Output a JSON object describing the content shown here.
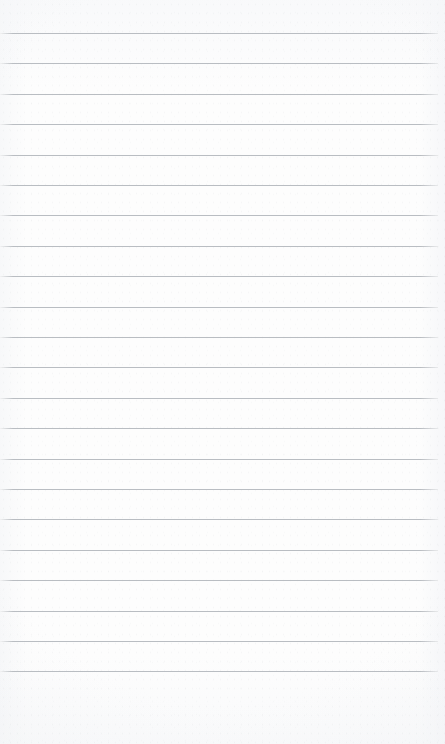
{
  "document": {
    "kind": "lined-notepad-page",
    "title": "",
    "body_text": "",
    "has_handwriting": false,
    "orientation": "portrait"
  },
  "page": {
    "width_px": 445,
    "height_px": 744,
    "background_color": "#fdfdfd",
    "paper_tone": "off-white scanned paper"
  },
  "ruling": {
    "line_color": "#b6babf",
    "line_thickness_px": 1,
    "line_count": 22,
    "first_line_y_px": 33,
    "line_spacing_px": 30.4,
    "line_left_x_px": 0,
    "line_right_x_px": 438,
    "line_width_px": 438,
    "top_margin_px": 33,
    "bottom_margin_px": 73,
    "line_y_positions": [
      33,
      63.4,
      93.8,
      124.2,
      154.6,
      185,
      215.4,
      245.8,
      276.2,
      306.6,
      337,
      367.4,
      397.8,
      428.2,
      458.6,
      489,
      519.4,
      549.8,
      580.2,
      610.6,
      641,
      671.4
    ]
  },
  "margins": {
    "left_rule_visible": false,
    "right_rule_visible": false,
    "header_area_empty": true,
    "footer_area_empty": true
  }
}
